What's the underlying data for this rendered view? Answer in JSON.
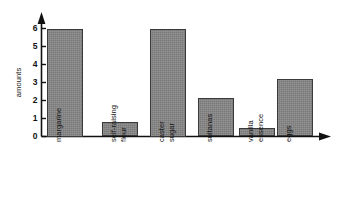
{
  "chart_data": {
    "type": "bar",
    "title": "",
    "xlabel": "",
    "ylabel": "amounts",
    "categories": [
      "margarine",
      "self-raising flour",
      "caster sugar",
      "sultanas",
      "vanilla essence",
      "eggs"
    ],
    "category_lines": [
      [
        "margarine"
      ],
      [
        "self-raising",
        "flour"
      ],
      [
        "caster",
        "sugar"
      ],
      [
        "sultanas"
      ],
      [
        "vanilla",
        "essence"
      ],
      [
        "eggs"
      ]
    ],
    "values": [
      6.0,
      0.8,
      6.0,
      2.15,
      0.45,
      3.2
    ],
    "ylim": [
      0,
      6.6
    ],
    "yticks": [
      0,
      1,
      2,
      3,
      4,
      5,
      6
    ],
    "ytick_labels": [
      "0",
      "1",
      "2",
      "3",
      "4",
      "5",
      "6"
    ],
    "grid": false,
    "legend": "none",
    "bar_color": "#868686",
    "bar_edge_color": "#3a3a3a",
    "axis_color": "#111111",
    "background_color": "#ffffff",
    "y_axis_arrow": true,
    "x_axis_arrow": true
  }
}
